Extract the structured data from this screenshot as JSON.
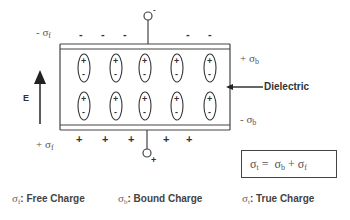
{
  "diagram": {
    "type": "dielectric-capacitor",
    "top_plate": {
      "charge_label": {
        "sign": "- ",
        "symbol": "σ",
        "subscript": "f"
      },
      "charges": [
        "-",
        "-",
        "-",
        "-",
        "-"
      ],
      "terminal_sign": "-"
    },
    "bottom_plate": {
      "charge_label": {
        "sign": "+ ",
        "symbol": "σ",
        "subscript": "f"
      },
      "charges": [
        "+",
        "+",
        "+",
        "+",
        "+"
      ],
      "terminal_sign": "+"
    },
    "field_label": "E",
    "dielectric_label": "Dielectric",
    "bound_top": {
      "sign": "+ ",
      "symbol": "σ",
      "subscript": "b"
    },
    "bound_bottom": {
      "sign": "- ",
      "symbol": "σ",
      "subscript": "b"
    },
    "dipoles": {
      "rows": 2,
      "columns": 5,
      "top_sign": "+",
      "bottom_sign": "-"
    },
    "equation": {
      "lhs_symbol": "σ",
      "lhs_sub": "t",
      "equals": " = ",
      "rhs1_symbol": "σ",
      "rhs1_sub": "b",
      "plus": " + ",
      "rhs2_symbol": "σ",
      "rhs2_sub": "f"
    },
    "legend": [
      {
        "symbol": "σ",
        "sub": "f",
        "text": ": Free Charge"
      },
      {
        "symbol": "σ",
        "sub": "b",
        "text": ": Bound Charge"
      },
      {
        "symbol": "σ",
        "sub": "t",
        "text": ": True Charge"
      }
    ]
  }
}
